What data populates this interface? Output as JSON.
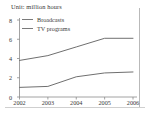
{
  "figure": {
    "unit_title": "Unit: million hours",
    "axis_color": "#8a8a8a",
    "line_color": "#6f6f6f",
    "text_color": "#3a3a3a",
    "frame_color": "#b9b9b9"
  },
  "chart_data": {
    "type": "line",
    "title": "Unit: million hours",
    "xlabel": "",
    "ylabel": "",
    "categories": [
      "2002",
      "2003",
      "2004",
      "2005",
      "2006"
    ],
    "x": [
      2002,
      2003,
      2004,
      2005,
      2006
    ],
    "xlim": [
      2002,
      2006
    ],
    "ylim": [
      0,
      8
    ],
    "yticks": [
      0,
      2,
      4,
      6,
      8
    ],
    "ytick_labels": [
      "0",
      "2",
      "4",
      "6",
      "8"
    ],
    "xtick_labels": [
      "2002",
      "2003",
      "2004",
      "2005",
      "2006"
    ],
    "grid": false,
    "legend_position": "upper left",
    "series": [
      {
        "name": "Broadcasts",
        "values": [
          3.8,
          4.3,
          5.2,
          6.1,
          6.1
        ]
      },
      {
        "name": "TV programs",
        "values": [
          1.0,
          1.1,
          2.1,
          2.5,
          2.6
        ]
      }
    ]
  }
}
